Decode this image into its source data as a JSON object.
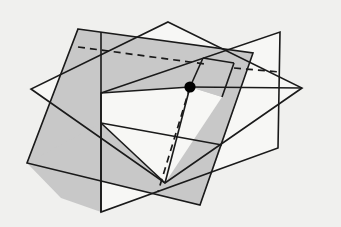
{
  "figure": {
    "background_color": "#f0f0ee",
    "line_color": "#1a1a1a",
    "gray_fill": "#c8c8c8",
    "white_fill": "#f7f7f5",
    "canvas": {
      "width": 341,
      "height": 227
    },
    "point": {
      "label": "intersection-point",
      "x": 190,
      "y": 87,
      "radius": 5.6,
      "color": "#000000"
    },
    "planes": [
      {
        "name": "gray-plane",
        "fill": "#c8c8c8",
        "points": "78,29 253,53 200,205 27,163"
      },
      {
        "name": "vertical-plane",
        "fill": "#f7f7f5",
        "points": "101,93 280,32 278,148 101,212"
      },
      {
        "name": "horizontal-plane",
        "fill": "#f7f7f5",
        "points": "168,22 302,88 165,183 31,89"
      }
    ],
    "gray_patch": {
      "name": "gray-patch-near-point",
      "fill": "#c8c8c8",
      "points": "190,87 203,58 234,63 222,97"
    },
    "solid_edges": [
      "78,29 253,53",
      "78,29 27,163",
      "27,163 200,205",
      "253,53 200,205",
      "101,93 280,32",
      "280,32 278,148",
      "278,148 101,212",
      "101,212 101,93",
      "168,22 302,88",
      "302,88 165,183",
      "165,183 31,89",
      "31,89 168,22"
    ],
    "dashed_edges": [
      "78,47 280,72",
      "190,87 158,192"
    ]
  }
}
